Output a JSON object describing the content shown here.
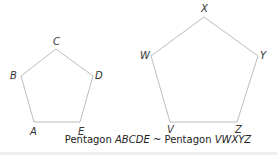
{
  "figure": {
    "stroke_color": "#bdbdbd",
    "small_pentagon": {
      "name": "ABCDE",
      "vertices": [
        {
          "label": "A",
          "x": 34,
          "y": 122,
          "lx": 30,
          "ly": 135
        },
        {
          "label": "B",
          "x": 21,
          "y": 76,
          "lx": 10,
          "ly": 79
        },
        {
          "label": "C",
          "x": 56,
          "y": 49,
          "lx": 53,
          "ly": 45
        },
        {
          "label": "D",
          "x": 93,
          "y": 76,
          "lx": 95,
          "ly": 79
        },
        {
          "label": "E",
          "x": 80,
          "y": 122,
          "lx": 78,
          "ly": 135
        }
      ]
    },
    "large_pentagon": {
      "name": "VWXYZ",
      "vertices": [
        {
          "label": "V",
          "x": 170,
          "y": 122,
          "lx": 167,
          "ly": 133
        },
        {
          "label": "W",
          "x": 151,
          "y": 56,
          "lx": 140,
          "ly": 59
        },
        {
          "label": "X",
          "x": 204,
          "y": 17,
          "lx": 201,
          "ly": 12
        },
        {
          "label": "Y",
          "x": 258,
          "y": 56,
          "lx": 260,
          "ly": 59
        },
        {
          "label": "Z",
          "x": 237,
          "y": 122,
          "lx": 235,
          "ly": 133
        }
      ]
    },
    "caption": {
      "prefix": "Pentagon ",
      "name1": "ABCDE",
      "relation": " ~ ",
      "prefix2": "Pentagon ",
      "name2": "VWXYZ"
    }
  }
}
